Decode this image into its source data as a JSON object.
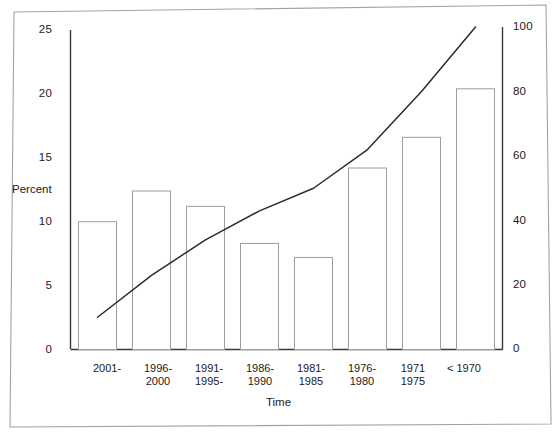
{
  "chart_data": {
    "type": "bar",
    "title": "",
    "subtitle": "",
    "xlabel": "Time",
    "ylabel": "Percent",
    "ylabel_right": "",
    "ylim": [
      0,
      25
    ],
    "ylim_right": [
      0,
      100
    ],
    "grid": false,
    "legend_position": "none",
    "categories": [
      "2001-",
      "1996-\n2000",
      "1991-\n1995-",
      "1986-\n1990",
      "1981-\n1985",
      "1976-\n1980",
      "1971\n1975",
      "< 1970"
    ],
    "category_lines": [
      [
        "2001-"
      ],
      [
        "1996-",
        "2000"
      ],
      [
        "1991-",
        "1995-"
      ],
      [
        "1986-",
        "1990"
      ],
      [
        "1981-",
        "1985"
      ],
      [
        "1976-",
        "1980"
      ],
      [
        "1971",
        "1975"
      ],
      [
        "< 1970"
      ]
    ],
    "series": [
      {
        "name": "Percent",
        "type": "bar",
        "axis": "left",
        "values": [
          10.0,
          12.4,
          11.2,
          8.3,
          7.2,
          14.2,
          16.6,
          20.4
        ]
      },
      {
        "name": "Cumulative percent",
        "type": "line",
        "axis": "right",
        "values": [
          10,
          23,
          34,
          43,
          50,
          62,
          80,
          100
        ]
      }
    ],
    "yticks_left": [
      "0",
      "5",
      "10",
      "15",
      "20",
      "25"
    ],
    "ytick_values_left": [
      0,
      5,
      10,
      15,
      20,
      25
    ],
    "yticks_right": [
      "0",
      "20",
      "40",
      "60",
      "80",
      "100"
    ],
    "ytick_values_right": [
      0,
      20,
      40,
      60,
      80,
      100
    ],
    "colors": {
      "bar_outline": "#8c8c8c",
      "bar_fill": "#ffffff",
      "line": "#2b2b2b",
      "axis": "#3a3a3a",
      "text": "#1a1a1a",
      "frame": "#9a9a9a",
      "background": "#ffffff"
    }
  }
}
